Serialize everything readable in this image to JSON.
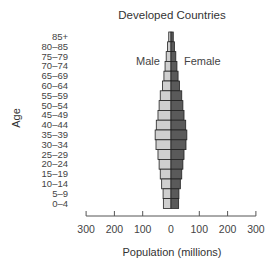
{
  "chart_data": {
    "type": "bar",
    "orientation": "horizontal-population-pyramid",
    "title": "Developed Countries",
    "xlabel": "Population (millions)",
    "ylabel": "Age",
    "xlim": [
      -300,
      300
    ],
    "xticks": [
      -300,
      -200,
      -100,
      0,
      100,
      200,
      300
    ],
    "xtick_labels": [
      "300",
      "200",
      "100",
      "0",
      "100",
      "200",
      "300"
    ],
    "grid": false,
    "legend": [
      {
        "name": "Male",
        "position": "left of center",
        "color": "#cfcfcf"
      },
      {
        "name": "Female",
        "position": "right of center",
        "color": "#5a5a5a"
      }
    ],
    "categories": [
      "85+",
      "80–85",
      "75–79",
      "70–74",
      "65–69",
      "60–64",
      "55–59",
      "50–54",
      "45–49",
      "40–44",
      "35–39",
      "30–34",
      "25–29",
      "20–24",
      "15–19",
      "10–14",
      "5–9",
      "0–4"
    ],
    "series": [
      {
        "name": "Male",
        "values": [
          8,
          12,
          17,
          21,
          25,
          30,
          38,
          42,
          46,
          52,
          56,
          53,
          46,
          42,
          38,
          33,
          28,
          27
        ]
      },
      {
        "name": "Female",
        "values": [
          8,
          12,
          17,
          21,
          25,
          30,
          38,
          42,
          46,
          52,
          56,
          53,
          46,
          42,
          38,
          33,
          28,
          27
        ]
      }
    ]
  },
  "labels": {
    "title": "Developed Countries",
    "male": "Male",
    "female": "Female",
    "ylabel": "Age",
    "xlabel": "Population (millions)"
  },
  "colors": {
    "male_bar": "#cfcfcf",
    "female_bar": "#5a5a5a",
    "outline": "#222222",
    "axis": "#555555"
  }
}
